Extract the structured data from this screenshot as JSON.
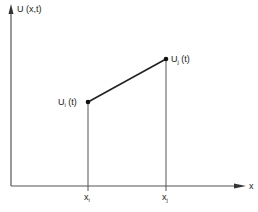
{
  "diagram": {
    "title": "",
    "y_axis_label": "U (x,t)",
    "x_axis_label": "x",
    "points": [
      {
        "name": "U_i(t)",
        "base": "U",
        "subscript": "i",
        "suffix": " (t)",
        "x_label_base": "x",
        "x_label_sub": "i"
      },
      {
        "name": "U_j(t)",
        "base": "U",
        "subscript": "j",
        "suffix": " (t)",
        "x_label_base": "x",
        "x_label_sub": "j"
      }
    ],
    "colors": {
      "axis": "#555555",
      "line": "#222222",
      "text": "#222222",
      "background": "#ffffff"
    }
  }
}
